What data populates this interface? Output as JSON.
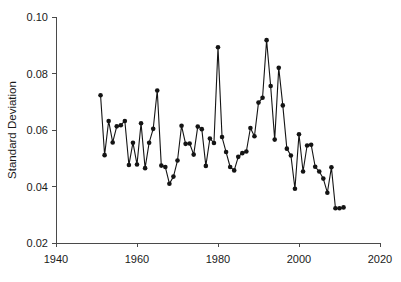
{
  "chart_data": {
    "type": "line",
    "title": "",
    "xlabel": "",
    "ylabel": "Standard Deviation",
    "xlim": [
      1940,
      2020
    ],
    "ylim": [
      0.02,
      0.1
    ],
    "xticks": [
      1940,
      1960,
      1980,
      2000,
      2020
    ],
    "xtick_labels": [
      "1940",
      "1960",
      "1980",
      "2000",
      "2020"
    ],
    "yticks": [
      0.02,
      0.04,
      0.06,
      0.08,
      0.1
    ],
    "ytick_labels": [
      "0.02",
      "0.04",
      "0.06",
      "0.08",
      "0.10"
    ],
    "grid": false,
    "legend": false,
    "marker": "filled-circle",
    "marker_color": "#141414",
    "line_color": "#141414",
    "series": [
      {
        "name": "Standard Deviation",
        "x": [
          1951,
          1952,
          1953,
          1954,
          1955,
          1956,
          1957,
          1958,
          1959,
          1960,
          1961,
          1962,
          1963,
          1964,
          1965,
          1966,
          1967,
          1968,
          1969,
          1970,
          1971,
          1972,
          1973,
          1974,
          1975,
          1976,
          1977,
          1978,
          1979,
          1980,
          1981,
          1982,
          1983,
          1984,
          1985,
          1986,
          1987,
          1988,
          1989,
          1990,
          1991,
          1992,
          1993,
          1994,
          1995,
          1996,
          1997,
          1998,
          1999,
          2000,
          2001,
          2002,
          2003,
          2004,
          2005,
          2006,
          2007,
          2008,
          2009,
          2010,
          2011
        ],
        "values": [
          0.0723,
          0.0511,
          0.0632,
          0.0556,
          0.0613,
          0.0617,
          0.0632,
          0.0476,
          0.0555,
          0.0478,
          0.0624,
          0.0465,
          0.0555,
          0.0604,
          0.074,
          0.0474,
          0.0469,
          0.041,
          0.0435,
          0.0492,
          0.0615,
          0.0551,
          0.0552,
          0.0513,
          0.0612,
          0.0603,
          0.0473,
          0.057,
          0.0554,
          0.0893,
          0.0575,
          0.0522,
          0.0469,
          0.0457,
          0.0505,
          0.0518,
          0.0524,
          0.0607,
          0.0578,
          0.0697,
          0.0714,
          0.0918,
          0.0756,
          0.0566,
          0.082,
          0.0687,
          0.0534,
          0.051,
          0.0392,
          0.0585,
          0.0453,
          0.0545,
          0.0548,
          0.047,
          0.0453,
          0.0428,
          0.0378,
          0.0468,
          0.0323,
          0.0323,
          0.0326
        ]
      }
    ]
  },
  "axis": {
    "y_title": "Standard Deviation"
  }
}
